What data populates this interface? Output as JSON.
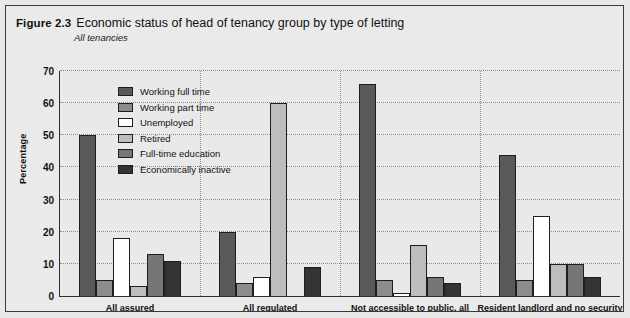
{
  "figure": {
    "number": "Figure 2.3",
    "title": "Economic status of head of tenancy group by type of letting",
    "subtitle": "All tenancies"
  },
  "chart_data": {
    "type": "bar",
    "title": "Economic status of head of tenancy group by type of letting",
    "subtitle": "All tenancies",
    "xlabel": "",
    "ylabel": "Percentage",
    "ylim": [
      0,
      70
    ],
    "yticks": [
      0,
      10,
      20,
      30,
      40,
      50,
      60,
      70
    ],
    "grid": true,
    "legend_position": "inside-top-left",
    "categories": [
      "All assured",
      "All regulated",
      "Not accessible to public, all",
      "Resident landlord and no security"
    ],
    "series": [
      {
        "name": "Working full time",
        "color": "#595959",
        "values": [
          50,
          20,
          66,
          44
        ]
      },
      {
        "name": "Working part time",
        "color": "#8c8c8c",
        "values": [
          5,
          4,
          5,
          5
        ]
      },
      {
        "name": "Unemployed",
        "color": "#ffffff",
        "values": [
          18,
          6,
          1,
          25
        ]
      },
      {
        "name": "Retired",
        "color": "#bdbdbd",
        "values": [
          3,
          60,
          16,
          10
        ]
      },
      {
        "name": "Full-time education",
        "color": "#767676",
        "values": [
          13,
          0,
          6,
          10
        ]
      },
      {
        "name": "Economically inactive",
        "color": "#333333",
        "values": [
          11,
          9,
          4,
          6
        ]
      }
    ]
  },
  "colors": {
    "page_background": "#e9e9e9",
    "plot_background": "#e9e9e9",
    "axis": "#2d2d2d",
    "gridline": "#8e8e8e",
    "text": "#121212"
  }
}
